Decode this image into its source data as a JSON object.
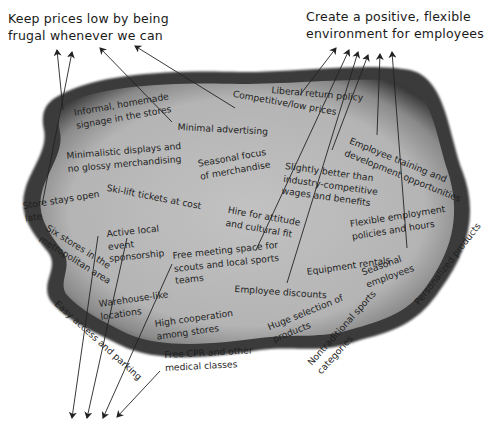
{
  "diagram": {
    "type": "activity-map",
    "background_color": "#ffffff",
    "blob_fill": "#b9b9b9",
    "blob_edge": "#3c3c3c",
    "ink_color": "#1e1e1e"
  },
  "goals": [
    {
      "id": "frugal",
      "lines": [
        "Keep prices low by being",
        "frugal whenever we can"
      ]
    },
    {
      "id": "employees",
      "lines": [
        "Create a positive, flexible",
        "environment for employees"
      ]
    }
  ],
  "activities": [
    {
      "id": "informal-signage",
      "lines": [
        "Informal, homemade",
        "signage in the stores"
      ]
    },
    {
      "id": "competitive-prices",
      "lines": [
        "Competitive/low prices"
      ]
    },
    {
      "id": "liberal-return",
      "lines": [
        "Liberal return policy"
      ]
    },
    {
      "id": "minimal-advertising",
      "lines": [
        "Minimal advertising"
      ]
    },
    {
      "id": "minimalistic-displays",
      "lines": [
        "Minimalistic displays and",
        "no glossy merchandising"
      ]
    },
    {
      "id": "seasonal-focus",
      "lines": [
        "Seasonal focus",
        "of merchandise"
      ]
    },
    {
      "id": "employee-training",
      "lines": [
        "Employee training and",
        "development opportunities"
      ]
    },
    {
      "id": "slightly-better-wages",
      "lines": [
        "Slightly better than",
        "industry-competitive",
        "wages and benefits"
      ]
    },
    {
      "id": "store-open-late",
      "lines": [
        "Store stays open",
        "late"
      ]
    },
    {
      "id": "ski-lift",
      "lines": [
        "Ski-lift tickets at cost"
      ]
    },
    {
      "id": "hire-for-attitude",
      "lines": [
        "Hire for attitude",
        "and cultural fit"
      ]
    },
    {
      "id": "flexible-employment",
      "lines": [
        "Flexible employment",
        "policies and hours"
      ]
    },
    {
      "id": "active-sponsorship",
      "lines": [
        "Active local",
        "event",
        "sponsorship"
      ]
    },
    {
      "id": "six-stores",
      "lines": [
        "Six stores in the",
        "metropolitan area"
      ]
    },
    {
      "id": "free-meeting-space",
      "lines": [
        "Free meeting space for",
        "scouts and local sports",
        "teams"
      ]
    },
    {
      "id": "personalized-products",
      "lines": [
        "Personalized products"
      ]
    },
    {
      "id": "equipment-rentals",
      "lines": [
        "Equipment rentals"
      ]
    },
    {
      "id": "seasonal-employees",
      "lines": [
        "Seasonal",
        "employees"
      ]
    },
    {
      "id": "employee-discounts",
      "lines": [
        "Employee discounts"
      ]
    },
    {
      "id": "warehouse-locations",
      "lines": [
        "Warehouse-like",
        "locations"
      ]
    },
    {
      "id": "easy-access",
      "lines": [
        "Easy access and parking"
      ]
    },
    {
      "id": "high-cooperation",
      "lines": [
        "High cooperation",
        "among stores"
      ]
    },
    {
      "id": "huge-selection",
      "lines": [
        "Huge selection of",
        "products"
      ]
    },
    {
      "id": "nontraditional-sports",
      "lines": [
        "Nontraditional sports",
        "categories"
      ]
    },
    {
      "id": "free-cpr",
      "lines": [
        "Free CPR and other",
        "medical classes"
      ]
    }
  ],
  "connections": [
    {
      "from": "informal-signage",
      "to": "frugal"
    },
    {
      "from": "minimalistic-displays",
      "to": "frugal"
    },
    {
      "from": "minimal-advertising",
      "to": "frugal"
    },
    {
      "from": "competitive-prices",
      "to": "frugal"
    },
    {
      "from": "liberal-return",
      "to": "employees"
    },
    {
      "from": "hire-for-attitude",
      "to": "employees"
    },
    {
      "from": "employee-discounts",
      "to": "employees"
    },
    {
      "from": "slightly-better-wages",
      "to": "employees"
    },
    {
      "from": "employee-training",
      "to": "employees"
    },
    {
      "from": "flexible-employment",
      "to": "employees"
    },
    {
      "from": "six-stores",
      "to": "bottom-offpage"
    },
    {
      "from": "active-sponsorship",
      "to": "bottom-offpage"
    },
    {
      "from": "free-meeting-space",
      "to": "bottom-offpage"
    },
    {
      "from": "free-cpr",
      "to": "bottom-offpage"
    }
  ]
}
